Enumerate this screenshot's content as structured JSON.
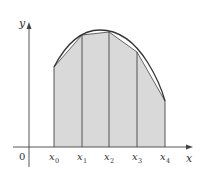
{
  "diagram": {
    "axis_labels": {
      "x": "x",
      "y": "y",
      "origin": "0"
    },
    "tick_labels": [
      {
        "main": "x",
        "sub": "0"
      },
      {
        "main": "x",
        "sub": "1"
      },
      {
        "main": "x",
        "sub": "2"
      },
      {
        "main": "x",
        "sub": "3"
      },
      {
        "main": "x",
        "sub": "4"
      }
    ],
    "colors": {
      "fill": "#d9d9d9",
      "line": "#333333",
      "curve": "#333333",
      "background": "#ffffff"
    }
  }
}
